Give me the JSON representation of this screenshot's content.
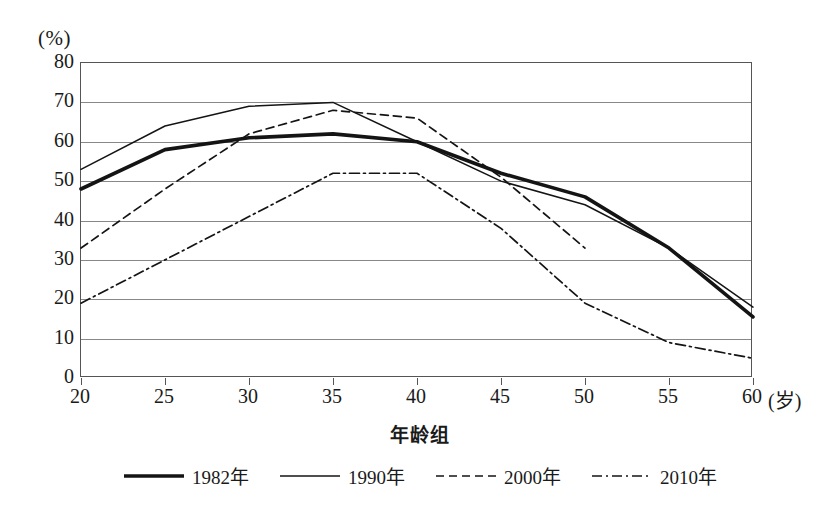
{
  "chart_data": {
    "type": "line",
    "title": "",
    "xlabel": "年龄组",
    "ylabel": "",
    "y_unit": "(%)",
    "x_unit": "(岁)",
    "x": [
      20,
      25,
      30,
      35,
      40,
      45,
      50,
      55,
      60
    ],
    "xtick_labels": [
      "20",
      "25",
      "30",
      "35",
      "40",
      "45",
      "50",
      "55",
      "60"
    ],
    "ytick_labels": [
      "0",
      "10",
      "20",
      "30",
      "40",
      "50",
      "60",
      "70",
      "80"
    ],
    "xlim": [
      20,
      60
    ],
    "ylim": [
      0,
      80
    ],
    "grid": "horizontal",
    "legend_position": "bottom",
    "series": [
      {
        "name": "1982年",
        "style": "thick-solid",
        "color": "#141414",
        "width": 3.6,
        "dash": "",
        "values": [
          48,
          58,
          61,
          62,
          60,
          52,
          46,
          33,
          15.5
        ]
      },
      {
        "name": "1990年",
        "style": "thin-solid",
        "color": "#141414",
        "width": 1.5,
        "dash": "",
        "values": [
          53,
          64,
          69,
          70,
          60,
          50,
          44,
          33,
          18
        ]
      },
      {
        "name": "2000年",
        "style": "dashed",
        "color": "#141414",
        "width": 1.7,
        "dash": "8,5",
        "values": [
          33,
          48,
          62,
          68,
          66,
          51,
          33,
          null,
          null
        ]
      },
      {
        "name": "2010年",
        "style": "dash-dot",
        "color": "#141414",
        "width": 1.7,
        "dash": "10,4,2,4",
        "values": [
          19,
          30,
          41,
          52,
          52,
          38,
          19,
          9,
          5
        ]
      }
    ]
  }
}
